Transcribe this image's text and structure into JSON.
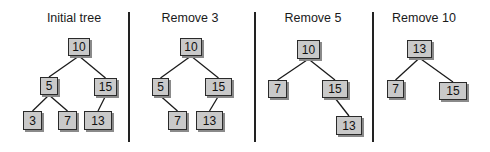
{
  "panels": [
    {
      "title": "Initial tree",
      "title_x": 74,
      "nodes": [
        {
          "label": "10",
          "x": 68,
          "y": 38,
          "w": 22,
          "h": 18
        },
        {
          "label": "5",
          "x": 40,
          "y": 77,
          "w": 18,
          "h": 18
        },
        {
          "label": "15",
          "x": 94,
          "y": 78,
          "w": 23,
          "h": 18
        },
        {
          "label": "3",
          "x": 23,
          "y": 111,
          "w": 19,
          "h": 19
        },
        {
          "label": "7",
          "x": 58,
          "y": 111,
          "w": 19,
          "h": 19
        },
        {
          "label": "13",
          "x": 84,
          "y": 111,
          "w": 28,
          "h": 19
        }
      ],
      "edges": [
        [
          0,
          1
        ],
        [
          0,
          2
        ],
        [
          1,
          3
        ],
        [
          1,
          4
        ],
        [
          2,
          5
        ]
      ]
    },
    {
      "title": "Remove 3",
      "title_x": 190,
      "nodes": [
        {
          "label": "10",
          "x": 180,
          "y": 38,
          "w": 22,
          "h": 18
        },
        {
          "label": "5",
          "x": 152,
          "y": 78,
          "w": 17,
          "h": 18
        },
        {
          "label": "15",
          "x": 205,
          "y": 78,
          "w": 27,
          "h": 18
        },
        {
          "label": "7",
          "x": 168,
          "y": 111,
          "w": 19,
          "h": 19
        },
        {
          "label": "13",
          "x": 196,
          "y": 111,
          "w": 27,
          "h": 19
        }
      ],
      "edges": [
        [
          0,
          1
        ],
        [
          0,
          2
        ],
        [
          1,
          3
        ],
        [
          2,
          4
        ]
      ]
    },
    {
      "title": "Remove 5",
      "title_x": 313,
      "nodes": [
        {
          "label": "10",
          "x": 297,
          "y": 40,
          "w": 23,
          "h": 19
        },
        {
          "label": "7",
          "x": 268,
          "y": 80,
          "w": 19,
          "h": 18
        },
        {
          "label": "15",
          "x": 322,
          "y": 80,
          "w": 26,
          "h": 18
        },
        {
          "label": "13",
          "x": 336,
          "y": 116,
          "w": 26,
          "h": 19
        }
      ],
      "edges": [
        [
          0,
          1
        ],
        [
          0,
          2
        ],
        [
          2,
          3
        ]
      ]
    },
    {
      "title": "Remove 10",
      "title_x": 424,
      "nodes": [
        {
          "label": "13",
          "x": 407,
          "y": 40,
          "w": 25,
          "h": 18
        },
        {
          "label": "7",
          "x": 387,
          "y": 80,
          "w": 17,
          "h": 18
        },
        {
          "label": "15",
          "x": 439,
          "y": 82,
          "w": 28,
          "h": 18
        }
      ],
      "edges": [
        [
          0,
          1
        ],
        [
          0,
          2
        ]
      ]
    }
  ],
  "dividers": [
    {
      "x": 128,
      "y1": 12,
      "y2": 142
    },
    {
      "x": 254,
      "y1": 12,
      "y2": 142
    },
    {
      "x": 372,
      "y1": 12,
      "y2": 142
    }
  ]
}
